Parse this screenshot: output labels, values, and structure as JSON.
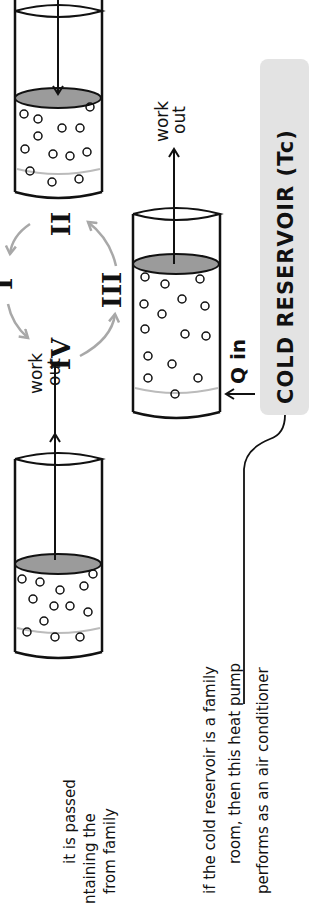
{
  "diagram": {
    "cycle_stages": [
      "I",
      "II",
      "III",
      "IV"
    ],
    "cold_reservoir_label": "COLD RESERVOIR (Tc)",
    "heat_label": "Q in",
    "work_labels": {
      "left_line1": "work",
      "left_line2": "out",
      "right_line1": "work",
      "right_line2": "out"
    },
    "annotation_left": {
      "line1": "it is passed",
      "line2": "ntaining the",
      "line3": "from family"
    },
    "annotation_bottom": {
      "line1": "if the cold reservoir is a family",
      "line2": "room, then this heat pump",
      "line3": "performs as an air conditioner"
    },
    "colors": {
      "reservoir_fill": "#e3e3e3",
      "piston_fill": "#9b9b9b",
      "cycle_arrow": "#a8a8a8",
      "ink": "#111111"
    }
  }
}
